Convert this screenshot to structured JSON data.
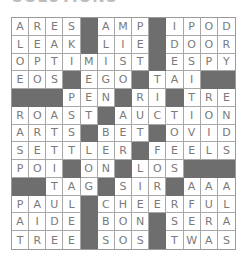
{
  "title": "SOLUTIONS",
  "grid": {
    "rows": 13,
    "cols": 13,
    "block_char": "#",
    "solution": [
      "ARES#AMP#IPOD",
      "LEAK#LIE#DOOR",
      "OPTIMIST#ESPY",
      "EOS#EGO#TAI##",
      "###PEN#RI#TRE",
      "ROAST#AUCTION",
      "ARTS#BET#OVID",
      "SETTLER#FEELS",
      "POI#ON#LOS###",
      "##TAG#SIR#AAA",
      "PAUL#CHEERFUL",
      "AIDE#BON#SERA",
      "TREE#SOS#TWAS"
    ]
  },
  "colors": {
    "block": "#6e6e6e",
    "letter": "#7a7a7a",
    "line": "#a8a8a8"
  }
}
